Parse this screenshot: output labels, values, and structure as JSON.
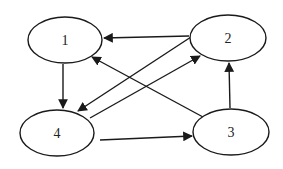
{
  "diagram": {
    "type": "directed-graph",
    "nodes": [
      {
        "id": "1",
        "label": "1",
        "cx": 65,
        "cy": 40,
        "rx": 37,
        "ry": 23
      },
      {
        "id": "2",
        "label": "2",
        "cx": 228,
        "cy": 38,
        "rx": 38,
        "ry": 23
      },
      {
        "id": "3",
        "label": "3",
        "cx": 231,
        "cy": 132,
        "rx": 38,
        "ry": 23
      },
      {
        "id": "4",
        "label": "4",
        "cx": 57,
        "cy": 133,
        "rx": 37,
        "ry": 23
      }
    ],
    "edges": [
      {
        "from": "2",
        "to": "1"
      },
      {
        "from": "1",
        "to": "4"
      },
      {
        "from": "2",
        "to": "4"
      },
      {
        "from": "4",
        "to": "2"
      },
      {
        "from": "3",
        "to": "1"
      },
      {
        "from": "4",
        "to": "3"
      },
      {
        "from": "3",
        "to": "2"
      }
    ],
    "colors": {
      "stroke": "#1a1a1a",
      "background": "#ffffff"
    }
  }
}
